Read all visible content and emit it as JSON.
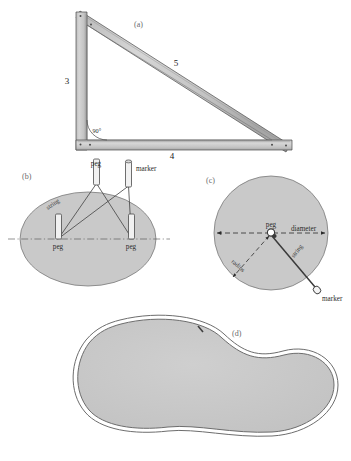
{
  "figure": {
    "background_color": "#ffffff",
    "fill_gray": "#c9c9c9",
    "stroke_dark": "#3a3a3a"
  },
  "panels": [
    {
      "id": "a",
      "label": "(a)",
      "kind": "right-triangle",
      "description": "Right triangle made of three flat rulers riveted at the corners",
      "labels": {
        "vertical_side": "3",
        "hypotenuse": "5",
        "horizontal_side": "4",
        "angle": "90°"
      }
    },
    {
      "id": "b",
      "label": "(b)",
      "kind": "ellipse-construction",
      "description": "Ellipse drawn with a loop of string around two pegs and a marker",
      "labels": {
        "peg_left": "peg",
        "peg_right": "peg",
        "peg_top": "peg",
        "marker": "marker",
        "string": "string"
      }
    },
    {
      "id": "c",
      "label": "(c)",
      "kind": "circle-construction",
      "description": "Circle drawn with a string tied to a central peg and a marker",
      "labels": {
        "peg": "peg",
        "diameter": "diameter",
        "radius": "radius",
        "string": "string",
        "marker": "marker"
      }
    },
    {
      "id": "d",
      "label": "(d)",
      "kind": "irregular-closed-curve",
      "description": "Irregular kidney shaped closed curve outlined by a loop of rope"
    }
  ]
}
